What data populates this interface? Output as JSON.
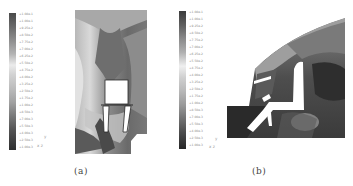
{
  "figure": {
    "panels": [
      {
        "id": "a",
        "caption": "(a)",
        "legend": {
          "labels": [
            "+1.08e-1",
            "+1.00e-1",
            "+9.25e-2",
            "+8.50e-2",
            "+7.75e-2",
            "+7.00e-2",
            "+6.25e-2",
            "+5.50e-2",
            "+4.75e-2",
            "+4.00e-2",
            "+3.25e-2",
            "+2.50e-2",
            "+1.75e-2",
            "+1.00e-2",
            "+8.50e-3",
            "+7.00e-3",
            "+5.50e-3",
            "+4.00e-3",
            "+2.50e-3",
            "+1.00e-3"
          ],
          "axis_marks": [
            "y",
            "x  z"
          ]
        }
      },
      {
        "id": "b",
        "caption": "(b)",
        "legend": {
          "labels": [
            "+1.08e-1",
            "+1.00e-1",
            "+9.25e-2",
            "+8.50e-2",
            "+7.75e-2",
            "+7.00e-2",
            "+6.25e-2",
            "+5.50e-2",
            "+4.75e-2",
            "+4.00e-2",
            "+3.25e-2",
            "+2.50e-2",
            "+1.75e-2",
            "+1.00e-2",
            "+8.50e-3",
            "+7.00e-3",
            "+5.50e-3",
            "+4.00e-3",
            "+2.50e-3",
            "+1.00e-3"
          ],
          "axis_marks": [
            "y",
            "x  z"
          ]
        }
      }
    ]
  }
}
